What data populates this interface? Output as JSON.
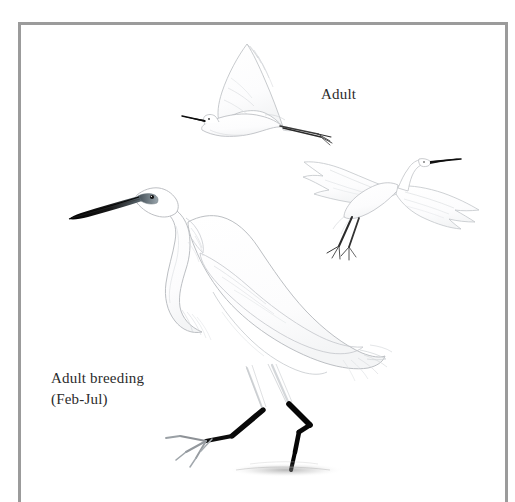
{
  "plate": {
    "background_color": "#ffffff",
    "frame_color": "#9b9b9b",
    "subject": "egret-field-guide-plate",
    "medium": "pencil-and-wash-illustration"
  },
  "labels": {
    "adult": "Adult",
    "adult_breeding": "Adult breeding",
    "adult_breeding_months": "(Feb-Jul)"
  },
  "figures": [
    {
      "id": "flying-egret-top",
      "name": "Adult in flight",
      "pose": "flying-left-wings-raised",
      "bill_color": "#111111",
      "leg_color": "#222222",
      "plumage_color": "#fdfdfd"
    },
    {
      "id": "landing-egret-right",
      "name": "Adult landing",
      "pose": "landing-wings-spread-legs-down",
      "bill_color": "#111111",
      "leg_color": "#2a2a2a",
      "plumage_color": "#fefefe"
    },
    {
      "id": "standing-egret-main",
      "name": "Adult breeding standing",
      "pose": "standing-wading-left-foot-lifted",
      "bill_color": "#0d0d0d",
      "lores_color": "#6f7a80",
      "eye_color": "#101010",
      "leg_color": "#080808",
      "plumage_color": "#fefefe"
    }
  ]
}
